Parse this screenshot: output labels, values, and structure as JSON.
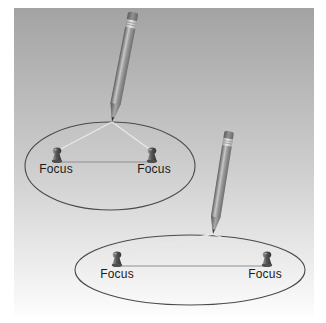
{
  "figure": {
    "type": "ellipse-construction-illustration",
    "panels": 2
  },
  "colors": {
    "page_background": "#ffffff",
    "panel_gradient_top": "#a3a3a3",
    "panel_gradient_mid": "#cccccc",
    "panel_gradient_bottom": "#fdfdfd",
    "ellipse_stroke": "#4a4a4a",
    "string": "#e8e8e8",
    "axis_line": "#8f8f8f",
    "label_text": "#1b1b1b",
    "pin_dark": "#3c3c3c",
    "pencil_body_dark": "#636363",
    "pencil_body_light": "#c7c7c7"
  },
  "diagram1": {
    "labels": {
      "left": "Focus",
      "right": "Focus"
    }
  },
  "diagram2": {
    "labels": {
      "left": "Focus",
      "right": "Focus"
    }
  }
}
